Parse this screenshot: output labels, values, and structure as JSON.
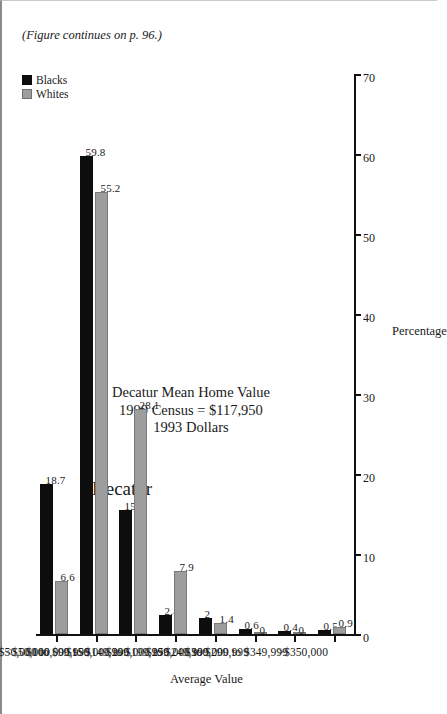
{
  "chart_data": {
    "type": "bar",
    "title": "Decatur",
    "xlabel": "Average Value",
    "ylabel": "Percentage",
    "ylim": [
      0,
      70
    ],
    "grid": false,
    "orientation": "horizontal-rotated",
    "legend_position": "top-right",
    "categories": [
      "<$50,000",
      "$50,000 to $99,999",
      "$100,000 to $149,999",
      "$150,000 to $199,999",
      "$200,000 to $249,999",
      "$250,000 to $299,999",
      "$300,000 to $349,999",
      ">$350,000"
    ],
    "tick_labels": [
      "0",
      "10",
      "20",
      "30",
      "40",
      "50",
      "60",
      "70"
    ],
    "ticks": [
      0,
      10,
      20,
      30,
      40,
      50,
      60,
      70
    ],
    "series": [
      {
        "name": "Blacks",
        "color": "#0d0d0d",
        "values": [
          18.7,
          59.8,
          15.5,
          2.4,
          2,
          0.6,
          0.4,
          0.5
        ],
        "labels": [
          "18.7",
          "59.8",
          "15.5",
          "2.4",
          "2",
          "0.6",
          "0.4",
          "0.5"
        ]
      },
      {
        "name": "Whites",
        "color": "#9d9d9d",
        "values": [
          6.6,
          55.2,
          28.1,
          7.9,
          1.4,
          0,
          0,
          0.9
        ],
        "labels": [
          "6.6",
          "55.2",
          "28.1",
          "7.9",
          "1.4",
          "0",
          "0",
          "0.9"
        ]
      }
    ],
    "annotation": {
      "line1": "Decatur Mean Home Value",
      "line2": "1990 Census = $117,950",
      "line3": "1993 Dollars"
    },
    "footer_note": "(Figure continues on p. 96.)"
  }
}
